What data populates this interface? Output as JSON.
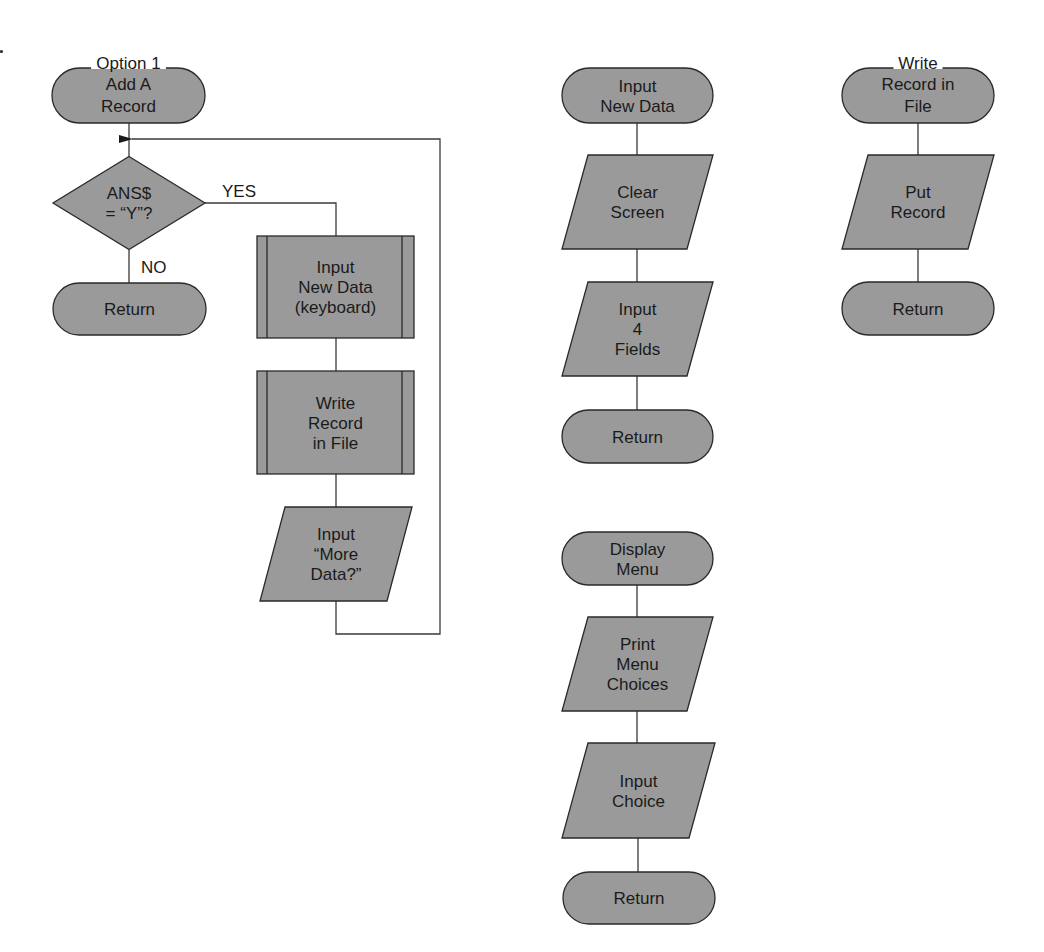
{
  "diagram": {
    "colors": {
      "fill": "#9a9a9a",
      "stroke": "#2a2a2a",
      "text": "#1a1a1a",
      "background": "#ffffff"
    },
    "nodes": [
      {
        "id": "add-record",
        "type": "terminator",
        "x": 52,
        "y": 68,
        "w": 153,
        "h": 55,
        "lines": [
          "Option 1",
          "Add A",
          "Record"
        ],
        "overlapTop": true
      },
      {
        "id": "ans-decision",
        "type": "decision",
        "cx": 129,
        "cy": 203,
        "w": 152,
        "h": 93,
        "lines": [
          "ANS$",
          "= “Y”?"
        ]
      },
      {
        "id": "return-1",
        "type": "terminator",
        "x": 53,
        "y": 283,
        "w": 153,
        "h": 52,
        "lines": [
          "Return"
        ]
      },
      {
        "id": "input-new-data-call",
        "type": "predefined",
        "x": 257,
        "y": 236,
        "w": 157,
        "h": 102,
        "lines": [
          "Input",
          "New Data",
          "(keyboard)"
        ]
      },
      {
        "id": "write-record-call",
        "type": "predefined",
        "x": 257,
        "y": 371,
        "w": 157,
        "h": 103,
        "lines": [
          "Write",
          "Record",
          "in File"
        ]
      },
      {
        "id": "input-more-data",
        "type": "io",
        "x": 260,
        "y": 507,
        "w": 152,
        "h": 94,
        "slant": 25,
        "lines": [
          "Input",
          "“More",
          "Data?”"
        ]
      },
      {
        "id": "input-new-data",
        "type": "terminator",
        "x": 562,
        "y": 68,
        "w": 151,
        "h": 55,
        "lines": [
          "Input",
          "New Data"
        ]
      },
      {
        "id": "clear-screen",
        "type": "io",
        "x": 562,
        "y": 155,
        "w": 151,
        "h": 94,
        "slant": 26,
        "lines": [
          "Clear",
          "Screen"
        ]
      },
      {
        "id": "input-4-fields",
        "type": "io",
        "x": 562,
        "y": 282,
        "w": 151,
        "h": 94,
        "slant": 26,
        "lines": [
          "Input",
          "4",
          "Fields"
        ]
      },
      {
        "id": "return-2",
        "type": "terminator",
        "x": 562,
        "y": 410,
        "w": 151,
        "h": 53,
        "lines": [
          "Return"
        ]
      },
      {
        "id": "write-record",
        "type": "terminator",
        "x": 842,
        "y": 68,
        "w": 152,
        "h": 55,
        "lines": [
          "Write",
          "Record in",
          "File"
        ],
        "overlapTop": true
      },
      {
        "id": "put-record",
        "type": "io",
        "x": 842,
        "y": 155,
        "w": 152,
        "h": 94,
        "slant": 26,
        "lines": [
          "Put",
          "Record"
        ]
      },
      {
        "id": "return-3",
        "type": "terminator",
        "x": 842,
        "y": 282,
        "w": 152,
        "h": 53,
        "lines": [
          "Return"
        ]
      },
      {
        "id": "display-menu",
        "type": "terminator",
        "x": 562,
        "y": 532,
        "w": 151,
        "h": 53,
        "lines": [
          "Display",
          "Menu"
        ]
      },
      {
        "id": "print-menu-choices",
        "type": "io",
        "x": 562,
        "y": 617,
        "w": 151,
        "h": 94,
        "slant": 26,
        "lines": [
          "Print",
          "Menu",
          "Choices"
        ]
      },
      {
        "id": "input-choice",
        "type": "io",
        "x": 562,
        "y": 743,
        "w": 153,
        "h": 95,
        "slant": 26,
        "lines": [
          "Input",
          "Choice"
        ]
      },
      {
        "id": "return-4",
        "type": "terminator",
        "x": 563,
        "y": 872,
        "w": 152,
        "h": 52,
        "lines": [
          "Return"
        ]
      }
    ],
    "edges": [
      {
        "from": "add-record",
        "to": "ans-decision",
        "points": [
          [
            129,
            123
          ],
          [
            129,
            157
          ]
        ]
      },
      {
        "from": "ans-decision",
        "to": "return-1",
        "label": "NO",
        "points": [
          [
            129,
            250
          ],
          [
            129,
            283
          ]
        ]
      },
      {
        "from": "ans-decision",
        "to": "input-new-data-call",
        "label": "YES",
        "points": [
          [
            205,
            203
          ],
          [
            336,
            203
          ],
          [
            336,
            236
          ]
        ]
      },
      {
        "from": "input-new-data-call",
        "to": "write-record-call",
        "points": [
          [
            336,
            338
          ],
          [
            336,
            371
          ]
        ]
      },
      {
        "from": "write-record-call",
        "to": "input-more-data",
        "points": [
          [
            336,
            474
          ],
          [
            336,
            507
          ]
        ]
      },
      {
        "from": "input-more-data",
        "to": "ans-decision",
        "loop": true,
        "arrow": true,
        "points": [
          [
            336,
            601
          ],
          [
            336,
            634
          ],
          [
            440,
            634
          ],
          [
            440,
            139
          ],
          [
            132,
            139
          ]
        ]
      },
      {
        "from": "input-new-data",
        "to": "clear-screen",
        "points": [
          [
            637,
            123
          ],
          [
            637,
            155
          ]
        ]
      },
      {
        "from": "clear-screen",
        "to": "input-4-fields",
        "points": [
          [
            637,
            249
          ],
          [
            637,
            282
          ]
        ]
      },
      {
        "from": "input-4-fields",
        "to": "return-2",
        "points": [
          [
            637,
            376
          ],
          [
            637,
            410
          ]
        ]
      },
      {
        "from": "write-record",
        "to": "put-record",
        "points": [
          [
            918,
            123
          ],
          [
            918,
            155
          ]
        ]
      },
      {
        "from": "put-record",
        "to": "return-3",
        "points": [
          [
            918,
            249
          ],
          [
            918,
            282
          ]
        ]
      },
      {
        "from": "display-menu",
        "to": "print-menu-choices",
        "points": [
          [
            637,
            585
          ],
          [
            637,
            617
          ]
        ]
      },
      {
        "from": "print-menu-choices",
        "to": "input-choice",
        "points": [
          [
            637,
            711
          ],
          [
            637,
            743
          ]
        ]
      },
      {
        "from": "input-choice",
        "to": "return-4",
        "points": [
          [
            638,
            838
          ],
          [
            638,
            872
          ]
        ]
      }
    ],
    "edge_labels": [
      {
        "text": "YES",
        "x": 222,
        "y": 197
      },
      {
        "text": "NO",
        "x": 141,
        "y": 273
      }
    ]
  }
}
